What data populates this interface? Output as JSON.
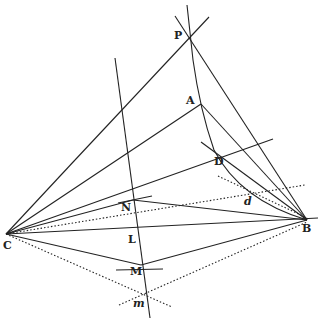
{
  "diagram": {
    "type": "geometric-construction",
    "points": {
      "P": {
        "label": "P",
        "x": 189,
        "y": 38
      },
      "A": {
        "label": "A",
        "x": 201,
        "y": 104
      },
      "D": {
        "label": "D",
        "x": 222,
        "y": 153
      },
      "d": {
        "label": "d",
        "x": 250,
        "y": 198
      },
      "N": {
        "label": "N",
        "x": 133,
        "y": 200
      },
      "L": {
        "label": "L",
        "x": 130,
        "y": 236
      },
      "M": {
        "label": "M",
        "x": 139,
        "y": 264
      },
      "m": {
        "label": "m",
        "x": 143,
        "y": 300
      },
      "C": {
        "label": "C",
        "x": 6,
        "y": 234
      },
      "B": {
        "label": "B",
        "x": 307,
        "y": 220
      }
    },
    "labels": [
      {
        "id": "P",
        "text": "P",
        "x": 174,
        "y": 32
      },
      {
        "id": "A",
        "text": "A",
        "x": 187,
        "y": 95
      },
      {
        "id": "D",
        "text": "D",
        "x": 214,
        "y": 158
      },
      {
        "id": "d",
        "text": "d",
        "x": 244,
        "y": 197
      },
      {
        "id": "N",
        "text": "N",
        "x": 121,
        "y": 203
      },
      {
        "id": "L",
        "text": "L",
        "x": 128,
        "y": 234
      },
      {
        "id": "M",
        "text": "M",
        "x": 130,
        "y": 266
      },
      {
        "id": "m",
        "text": "m",
        "x": 133,
        "y": 299
      },
      {
        "id": "C",
        "text": "C",
        "x": 3,
        "y": 240
      },
      {
        "id": "B",
        "text": "B",
        "x": 302,
        "y": 223
      }
    ],
    "line_color": "#222222"
  }
}
